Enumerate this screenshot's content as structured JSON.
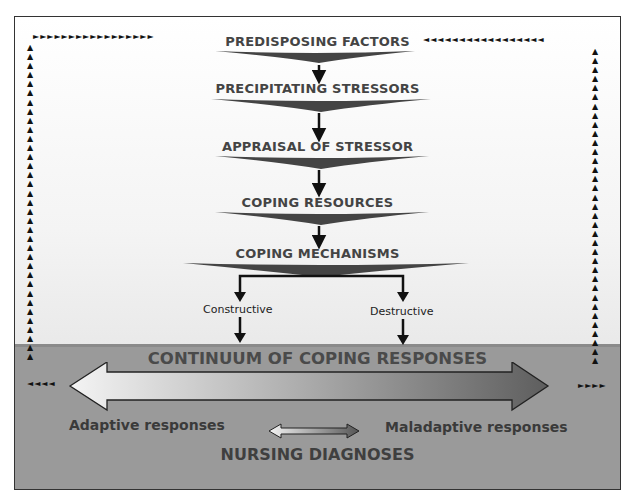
{
  "diagram": {
    "stages": [
      {
        "label": "PREDISPOSING FACTORS"
      },
      {
        "label": "PRECIPITATING STRESSORS"
      },
      {
        "label": "APPRAISAL OF STRESSOR"
      },
      {
        "label": "COPING RESOURCES"
      },
      {
        "label": "COPING MECHANISMS"
      }
    ],
    "branches": {
      "left": "Constructive",
      "right": "Destructive"
    },
    "continuum": {
      "title": "CONTINUUM OF COPING RESPONSES",
      "adaptive": "Adaptive responses",
      "maladaptive": "Maladaptive responses"
    },
    "footer": "NURSING DIAGNOSES",
    "feedback_loop": {
      "description": "Dotted arrow feedback loop from both ends of continuum back up to predisposing factors",
      "glyph_right": "►",
      "glyph_left": "◄",
      "glyph_up": "▲"
    },
    "colors": {
      "background_top": "#ffffff",
      "background_bottom_panel": "#9a9a9a",
      "wedge": "#4a4a4a",
      "stage_text": "#444444",
      "adaptive_arrow": "#eeeeee",
      "maladaptive_arrow": "#666666"
    }
  }
}
